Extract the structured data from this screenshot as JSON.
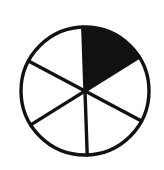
{
  "figure": {
    "name": "fraction-pie-diagram",
    "title": "",
    "background_color": "#ffffff",
    "width": 164,
    "height": 170
  },
  "chart_data": {
    "type": "pie",
    "title": "",
    "subtitle": "",
    "xlabel": "",
    "ylabel": "",
    "categories": [
      "sector-1",
      "sector-2",
      "sector-3",
      "sector-4",
      "sector-5",
      "sector-6"
    ],
    "values": [
      1,
      1,
      1,
      1,
      1,
      1
    ],
    "slice_count": 6,
    "slice_angle_degrees": 60,
    "shaded_slices": [
      "sector-1"
    ],
    "shaded_count": 1,
    "unshaded_count": 5,
    "fraction_shaded": "1/6",
    "fraction_numerator": 1,
    "fraction_denominator": 6,
    "percent_shaded": 16.67,
    "slice_fill_colors": [
      "#111111",
      "#ffffff",
      "#ffffff",
      "#ffffff",
      "#ffffff",
      "#ffffff"
    ],
    "outline_color": "#111111",
    "stroke_width": 3.4,
    "start_angle_degrees": -90,
    "legend": [],
    "legend_position": "none",
    "grid": false,
    "annotations": []
  },
  "geometry": {
    "center_x": 85,
    "center_y": 91,
    "radius": 64,
    "rotation_degrees": -2
  },
  "icons": {
    "pie_icon": "pie-chart-icon",
    "shaded_sector": "filled-sector-icon"
  }
}
